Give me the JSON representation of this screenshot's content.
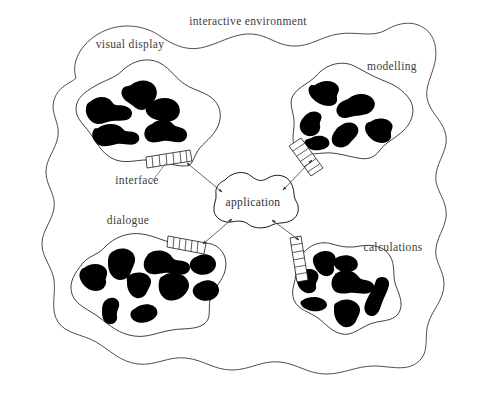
{
  "diagram": {
    "title": "interactive environment",
    "environment_label": "interactive environment",
    "center_label": "application",
    "interface_label": "interface",
    "colors": {
      "background": "#ffffff",
      "stroke": "#2a2a2a",
      "blob_fill": "#000000",
      "text": "#3c3c3c",
      "connector": "#4a4a4a"
    },
    "modules": [
      {
        "id": "visual-display",
        "label": "visual display",
        "blob_count": 5,
        "position": "top-left"
      },
      {
        "id": "modelling",
        "label": "modelling",
        "blob_count": 6,
        "position": "top-right"
      },
      {
        "id": "dialogue",
        "label": "dialogue",
        "blob_count": 9,
        "position": "bottom-left"
      },
      {
        "id": "calculations",
        "label": "calculations",
        "blob_count": 6,
        "position": "bottom-right"
      }
    ],
    "connections": [
      {
        "from": "application",
        "to": "visual-display",
        "style": "double-arrow"
      },
      {
        "from": "application",
        "to": "modelling",
        "style": "double-arrow"
      },
      {
        "from": "application",
        "to": "dialogue",
        "style": "double-arrow"
      },
      {
        "from": "application",
        "to": "calculations",
        "style": "double-arrow"
      }
    ],
    "interfaces": [
      {
        "id": "interface-visual-display",
        "attached_to": "visual-display",
        "labelled": true
      },
      {
        "id": "interface-modelling",
        "attached_to": "modelling",
        "labelled": false
      },
      {
        "id": "interface-dialogue",
        "attached_to": "dialogue",
        "labelled": false
      },
      {
        "id": "interface-calculations",
        "attached_to": "calculations",
        "labelled": false
      }
    ]
  }
}
